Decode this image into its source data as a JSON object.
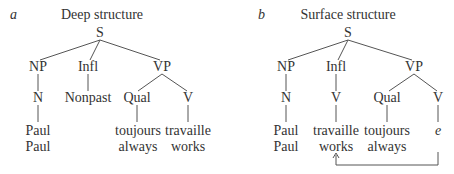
{
  "colors": {
    "line": "#555555",
    "text": "#333333",
    "background": "#ffffff"
  },
  "panels": [
    {
      "letter": "a",
      "title": "Deep structure",
      "nodes": {
        "s": "S",
        "np": "NP",
        "infl": "Infl",
        "vp": "VP",
        "n": "N",
        "infl_child": "Nonpast",
        "qual": "Qual",
        "v": "V",
        "leaf_paul_fr": "Paul",
        "leaf_paul_en": "Paul",
        "leaf_qual_fr": "toujours",
        "leaf_qual_en": "always",
        "leaf_v_fr": "travaille",
        "leaf_v_en": "works"
      }
    },
    {
      "letter": "b",
      "title": "Surface structure",
      "nodes": {
        "s": "S",
        "np": "NP",
        "infl": "Infl",
        "vp": "VP",
        "n": "N",
        "infl_child": "V",
        "qual": "Qual",
        "v": "V",
        "leaf_paul_fr": "Paul",
        "leaf_paul_en": "Paul",
        "leaf_infl_fr": "travaille",
        "leaf_infl_en": "works",
        "leaf_qual_fr": "toujours",
        "leaf_qual_en": "always",
        "leaf_v_trace": "e"
      },
      "movement_arrow": {
        "from": "V trace e",
        "to": "Infl V travaille"
      }
    }
  ]
}
